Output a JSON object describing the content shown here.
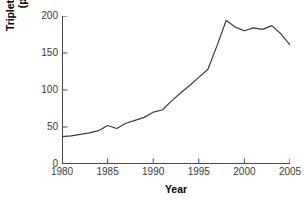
{
  "chart_data": {
    "type": "line",
    "title": "",
    "xlabel": "Year",
    "ylabel": "Triplet and higher multiple births (per 100,000 live births)",
    "ylabel_line1": "Triplet and higher multiple births",
    "ylabel_line2": "(per 100,000 live births)",
    "xlim": [
      1980,
      2005
    ],
    "ylim": [
      0,
      200
    ],
    "xticks": [
      1980,
      1985,
      1990,
      1995,
      2000,
      2005
    ],
    "xtick_labels": [
      "1980",
      "1985",
      "1990",
      "1995",
      "2000",
      "2005"
    ],
    "yticks": [
      0,
      50,
      100,
      150,
      200
    ],
    "ytick_labels": [
      "0",
      "50",
      "100",
      "150",
      "200"
    ],
    "grid": false,
    "legend": null,
    "line_color": "#3c3c3c",
    "line_width": 1.2,
    "x": [
      1980,
      1981,
      1982,
      1983,
      1984,
      1985,
      1986,
      1987,
      1988,
      1989,
      1990,
      1991,
      1992,
      1993,
      1994,
      1995,
      1996,
      1997,
      1998,
      1999,
      2000,
      2001,
      2002,
      2003,
      2004,
      2005
    ],
    "values": [
      37,
      38,
      40,
      42,
      45,
      52,
      48,
      55,
      59,
      63,
      70,
      73,
      85,
      96,
      106,
      117,
      128,
      160,
      194,
      185,
      180,
      184,
      182,
      187,
      176,
      161
    ],
    "series": [
      {
        "name": "Triplet and higher-order multiple birth rate",
        "values": [
          37,
          38,
          40,
          42,
          45,
          52,
          48,
          55,
          59,
          63,
          70,
          73,
          85,
          96,
          106,
          117,
          128,
          160,
          194,
          185,
          180,
          184,
          182,
          187,
          176,
          161
        ]
      }
    ]
  }
}
